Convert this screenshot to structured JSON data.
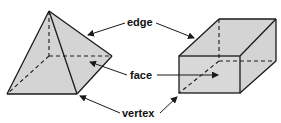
{
  "diagram": {
    "labels": {
      "edge": "edge",
      "face": "face",
      "vertex": "vertex"
    },
    "shapes": [
      "pyramid",
      "rectangular-prism"
    ],
    "colors": {
      "face_fill": "#d4d4d4",
      "line": "#1a1a1a",
      "background": "#ffffff"
    }
  }
}
